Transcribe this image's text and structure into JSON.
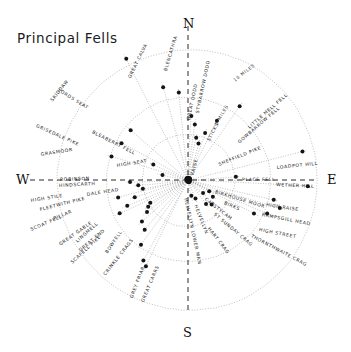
{
  "title": "Principal Fells",
  "colors": {
    "ink": "#141414",
    "ring": "#8a8a8a",
    "ray": "#6f6f6f",
    "hub": "#111111"
  },
  "cardinals": [
    {
      "name": "north",
      "label": "N",
      "x": 183,
      "y": 16
    },
    {
      "name": "south",
      "label": "S",
      "x": 183,
      "y": 325
    },
    {
      "name": "east",
      "label": "E",
      "x": 327,
      "y": 172
    },
    {
      "name": "west",
      "label": "W",
      "x": 16,
      "y": 172
    }
  ],
  "center": {
    "x": 188,
    "y": 180
  },
  "rings": [
    {
      "name": "inner-ring",
      "r": 46
    },
    {
      "name": "mid-ring",
      "r": 82
    },
    {
      "name": "outer-ring",
      "r": 130
    }
  ],
  "scale_labels": [
    {
      "name": "ten-miles",
      "text": "10 MILES",
      "x": 234,
      "y": 78,
      "rot": -38
    },
    {
      "name": "five-miles",
      "text": "5 MILES",
      "x": 216,
      "y": 122,
      "rot": -60
    }
  ],
  "fells": [
    {
      "label": "SKIDDAW",
      "angle": -27,
      "dot": 136,
      "lx": 52,
      "ly": 99,
      "rot": -52
    },
    {
      "label": "GREAT CALVA",
      "angle": -15,
      "dot": 96,
      "lx": 130,
      "ly": 76,
      "rot": -64
    },
    {
      "label": "BLENCATHRA",
      "angle": -6,
      "dot": 88,
      "lx": 166,
      "ly": 69,
      "rot": -73
    },
    {
      "label": "GREAT DODD",
      "angle": 3,
      "dot": 64,
      "lx": 189,
      "ly": 118,
      "rot": -78
    },
    {
      "label": "STYBARROW DODD",
      "angle": 7,
      "dot": 56,
      "lx": 198,
      "ly": 111,
      "rot": -78
    },
    {
      "label": "RAISE",
      "angle": 11,
      "dot": 43,
      "lx": 193,
      "ly": 173,
      "rot": -76
    },
    {
      "label": "STICKS",
      "angle": 16,
      "dot": 38,
      "lx": 209,
      "ly": 139,
      "rot": -63
    },
    {
      "label": "GOWBARROW FELL",
      "angle": 26,
      "dot": 66,
      "lx": 239,
      "ly": 141,
      "rot": -41
    },
    {
      "label": "LITTLE MELL FELL",
      "angle": 35,
      "dot": 90,
      "lx": 249,
      "ly": 126,
      "rot": -41
    },
    {
      "label": "SHEFFIELD PIKE",
      "angle": 20,
      "dot": 50,
      "lx": 219,
      "ly": 163,
      "rot": -22
    },
    {
      "label": "LOADPOT HILL",
      "angle": 76,
      "dot": 118,
      "lx": 277,
      "ly": 166,
      "rot": -6
    },
    {
      "label": "PLACE FELL",
      "angle": 86,
      "dot": 48,
      "lx": 242,
      "ly": 178,
      "rot": 0
    },
    {
      "label": "WETHER HILL",
      "angle": 93,
      "dot": 120,
      "lx": 276,
      "ly": 183,
      "rot": 3
    },
    {
      "label": "HIGH RAISE",
      "angle": 103,
      "dot": 88,
      "lx": 266,
      "ly": 203,
      "rot": 9
    },
    {
      "label": "RAMPSGILL HEAD",
      "angle": 107,
      "dot": 96,
      "lx": 262,
      "ly": 213,
      "rot": 11
    },
    {
      "label": "HIGH STREET",
      "angle": 113,
      "dot": 86,
      "lx": 259,
      "ly": 228,
      "rot": 11
    },
    {
      "label": "THORNTHWAITE CRAG",
      "angle": 117,
      "dot": 74,
      "lx": 251,
      "ly": 234,
      "rot": 28
    },
    {
      "label": "BIRKHOUSE MOOR",
      "angle": 118,
      "dot": 24,
      "lx": 215,
      "ly": 190,
      "rot": 17
    },
    {
      "label": "BIRKS",
      "angle": 124,
      "dot": 30,
      "lx": 224,
      "ly": 201,
      "rot": 23
    },
    {
      "label": "CATSTYCAM",
      "angle": 131,
      "dot": 20,
      "lx": 205,
      "ly": 197,
      "rot": 38
    },
    {
      "label": "ST SUNDAY CRAG",
      "angle": 136,
      "dot": 34,
      "lx": 214,
      "ly": 212,
      "rot": 40
    },
    {
      "label": "HART CRAG",
      "angle": 143,
      "dot": 30,
      "lx": 208,
      "ly": 226,
      "rot": 52
    },
    {
      "label": "HELVELLYN",
      "angle": 158,
      "dot": 20,
      "lx": 195,
      "ly": 203,
      "rot": 69
    },
    {
      "label": "HELVELLYN LOWER MAN",
      "angle": 168,
      "dot": 16,
      "lx": 185,
      "ly": 196,
      "rot": 78
    },
    {
      "label": "GREAT CARRS",
      "angle": 206,
      "dot": 96,
      "lx": 143,
      "ly": 300,
      "rot": -67
    },
    {
      "label": "GREY FRIAR",
      "angle": 209,
      "dot": 92,
      "lx": 132,
      "ly": 296,
      "rot": -69
    },
    {
      "label": "CRINKLE CRAGS",
      "angle": 216,
      "dot": 80,
      "lx": 105,
      "ly": 273,
      "rot": -52
    },
    {
      "label": "BOWFELL",
      "angle": 221,
      "dot": 66,
      "lx": 107,
      "ly": 251,
      "rot": -56
    },
    {
      "label": "SCAFELL PIKE",
      "angle": 228,
      "dot": 62,
      "lx": 72,
      "ly": 261,
      "rot": -43
    },
    {
      "label": "GREAT END",
      "angle": 232,
      "dot": 52,
      "lx": 80,
      "ly": 249,
      "rot": -40
    },
    {
      "label": "LINGMELL",
      "angle": 236,
      "dot": 48,
      "lx": 77,
      "ly": 240,
      "rot": -42
    },
    {
      "label": "GREAT GABLE",
      "angle": 239,
      "dot": 44,
      "lx": 60,
      "ly": 243,
      "rot": -35
    },
    {
      "label": "SCOAT FELL",
      "angle": 244,
      "dot": 76,
      "lx": 31,
      "ly": 228,
      "rot": -23
    },
    {
      "label": "PILLAR",
      "angle": 247,
      "dot": 66,
      "lx": 54,
      "ly": 217,
      "rot": -22
    },
    {
      "label": "FLEETWITH PIKE",
      "angle": 252,
      "dot": 56,
      "lx": 40,
      "ly": 208,
      "rot": -14
    },
    {
      "label": "HIGH STILE",
      "angle": 256,
      "dot": 72,
      "lx": 31,
      "ly": 199,
      "rot": -9
    },
    {
      "label": "DALE HEAD",
      "angle": 259,
      "dot": 46,
      "lx": 87,
      "ly": 193,
      "rot": -9
    },
    {
      "label": "HINDSCARTH",
      "angle": 264,
      "dot": 50,
      "lx": 59,
      "ly": 184,
      "rot": -3
    },
    {
      "label": "ROBINSON",
      "angle": 268,
      "dot": 58,
      "lx": 60,
      "ly": 178,
      "rot": -2
    },
    {
      "label": "HIGH SEAT",
      "angle": 281,
      "dot": 26,
      "lx": 117,
      "ly": 164,
      "rot": -9
    },
    {
      "label": "GRASMOOR",
      "angle": 287,
      "dot": 80,
      "lx": 41,
      "ly": 153,
      "rot": -9
    },
    {
      "label": "BLEABERRY FELL",
      "angle": 294,
      "dot": 38,
      "lx": 92,
      "ly": 130,
      "rot": 27
    },
    {
      "label": "GRISEDALE PIKE",
      "angle": 299,
      "dot": 76,
      "lx": 36,
      "ly": 124,
      "rot": 24
    },
    {
      "label": "LORDS SEAT",
      "angle": 311,
      "dot": 76,
      "lx": 58,
      "ly": 88,
      "rot": 32
    }
  ]
}
